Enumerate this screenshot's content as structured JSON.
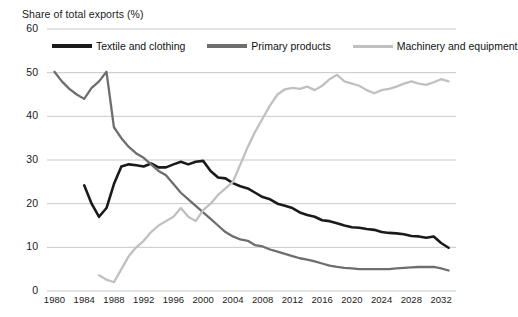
{
  "chart_data": {
    "type": "line",
    "title": "Share of total exports (%)",
    "xlabel": "",
    "ylabel": "Share of total exports (%)",
    "ylim": [
      0,
      60
    ],
    "xlim": [
      1979,
      2034
    ],
    "grid": true,
    "legend_position": "top",
    "ytick_labels": [
      "60",
      "50",
      "40",
      "30",
      "20",
      "10",
      "0"
    ],
    "ytick_values": [
      60,
      50,
      40,
      30,
      20,
      10,
      0
    ],
    "xtick_labels": [
      "1980",
      "1984",
      "1988",
      "1992",
      "1996",
      "2000",
      "2004",
      "2008",
      "2012",
      "2016",
      "2020",
      "2024",
      "2028",
      "2032"
    ],
    "xtick_values": [
      1980,
      1984,
      1988,
      1992,
      1996,
      2000,
      2004,
      2008,
      2012,
      2016,
      2020,
      2024,
      2028,
      2032
    ],
    "series": [
      {
        "name": "Textile and clothing",
        "color": "#1a1a1a",
        "x": [
          1984,
          1985,
          1986,
          1987,
          1988,
          1989,
          1990,
          1991,
          1992,
          1993,
          1994,
          1995,
          1996,
          1997,
          1998,
          1999,
          2000,
          2001,
          2002,
          2003,
          2004,
          2005,
          2006,
          2007,
          2008,
          2009,
          2010,
          2011,
          2012,
          2013,
          2014,
          2015,
          2016,
          2017,
          2018,
          2019,
          2020,
          2021,
          2022,
          2023,
          2024,
          2025,
          2026,
          2027,
          2028,
          2029,
          2030,
          2031,
          2032,
          2033
        ],
        "values": [
          24.2,
          20.0,
          17.0,
          19.0,
          24.5,
          28.5,
          29.0,
          28.8,
          28.5,
          29.2,
          28.3,
          28.3,
          29.0,
          29.6,
          29.0,
          29.6,
          29.8,
          27.5,
          26.0,
          25.8,
          24.7,
          24.0,
          23.5,
          22.5,
          21.5,
          21.0,
          20.0,
          19.5,
          19.0,
          18.0,
          17.4,
          17.0,
          16.2,
          16.0,
          15.5,
          15.0,
          14.6,
          14.5,
          14.2,
          14.0,
          13.5,
          13.3,
          13.2,
          13.0,
          12.6,
          12.5,
          12.2,
          12.5,
          11.0,
          9.9
        ]
      },
      {
        "name": "Primary products",
        "color": "#6e6e6e",
        "x": [
          1980,
          1981,
          1982,
          1983,
          1984,
          1985,
          1986,
          1987,
          1988,
          1989,
          1990,
          1991,
          1992,
          1993,
          1994,
          1995,
          1996,
          1997,
          1998,
          1999,
          2000,
          2001,
          2002,
          2003,
          2004,
          2005,
          2006,
          2007,
          2008,
          2009,
          2010,
          2011,
          2012,
          2013,
          2014,
          2015,
          2016,
          2017,
          2018,
          2019,
          2020,
          2021,
          2022,
          2023,
          2024,
          2025,
          2026,
          2027,
          2028,
          2029,
          2030,
          2031,
          2032,
          2033
        ],
        "values": [
          50.2,
          48.0,
          46.3,
          45.0,
          44.0,
          46.5,
          48.0,
          50.2,
          37.5,
          35.0,
          33.0,
          31.5,
          30.5,
          29.0,
          27.5,
          26.5,
          24.5,
          22.5,
          21.0,
          19.5,
          18.0,
          16.5,
          15.0,
          13.5,
          12.5,
          11.8,
          11.5,
          10.5,
          10.2,
          9.5,
          9.0,
          8.5,
          8.0,
          7.5,
          7.2,
          6.8,
          6.3,
          5.8,
          5.5,
          5.3,
          5.2,
          5.0,
          5.0,
          5.0,
          5.0,
          5.0,
          5.2,
          5.3,
          5.4,
          5.5,
          5.5,
          5.5,
          5.2,
          4.7
        ]
      },
      {
        "name": "Machinery and equipment",
        "color": "#c0c0c0",
        "x": [
          1986,
          1987,
          1988,
          1989,
          1990,
          1991,
          1992,
          1993,
          1994,
          1995,
          1996,
          1997,
          1998,
          1999,
          2000,
          2001,
          2002,
          2003,
          2004,
          2005,
          2006,
          2007,
          2008,
          2009,
          2010,
          2011,
          2012,
          2013,
          2014,
          2015,
          2016,
          2017,
          2018,
          2019,
          2020,
          2021,
          2022,
          2023,
          2024,
          2025,
          2026,
          2027,
          2028,
          2029,
          2030,
          2031,
          2032,
          2033
        ],
        "values": [
          3.6,
          2.6,
          2.0,
          5.0,
          8.0,
          10.0,
          11.5,
          13.5,
          15.0,
          16.0,
          17.0,
          19.0,
          17.0,
          16.0,
          18.5,
          20.0,
          22.0,
          23.5,
          25.0,
          29.0,
          33.0,
          36.5,
          39.5,
          42.5,
          45.0,
          46.2,
          46.5,
          46.3,
          46.8,
          46.0,
          47.0,
          48.5,
          49.5,
          48.0,
          47.5,
          47.0,
          46.0,
          45.3,
          46.0,
          46.3,
          46.8,
          47.5,
          48.0,
          47.5,
          47.2,
          47.8,
          48.5,
          48.0
        ]
      }
    ]
  },
  "legend": {
    "items": [
      {
        "label": "Textile and clothing",
        "color": "#1a1a1a",
        "swatch": "thick-line-swatch"
      },
      {
        "label": "Primary products",
        "color": "#6e6e6e",
        "swatch": "mid-line-swatch"
      },
      {
        "label": "Machinery and equipment",
        "color": "#c0c0c0",
        "swatch": "light-line-swatch"
      }
    ]
  }
}
